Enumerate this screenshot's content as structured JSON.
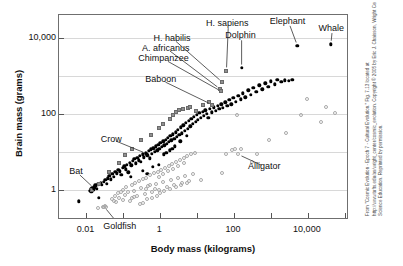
{
  "figure": {
    "credit": "From \"Cosmic Evolution - Epoch 7 - Cultural Evolution.\" Fig. 7.13 located at http://www.tufts.edu/as/wright_center/cosmic_evolution. Copyright © 2005 by Eric J. Chaisson, Wright Center for Science Education. Reprinted by permission."
  },
  "chart_data": {
    "type": "scatter",
    "title": "",
    "xlabel": "Body mass (kilograms)",
    "ylabel": "Brain mass (grams)",
    "xscale": "log",
    "yscale": "log",
    "xlim": [
      0.0018,
      130000
    ],
    "ylim": [
      0.16,
      40000
    ],
    "grid": true,
    "legend_position": "none",
    "xticks": [
      {
        "value": 0.01,
        "label": "0.01"
      },
      {
        "value": 1,
        "label": "1"
      },
      {
        "value": 100,
        "label": "100"
      },
      {
        "value": 10000,
        "label": "10,000"
      }
    ],
    "xminorticks": [
      0.1,
      10,
      1000,
      100000
    ],
    "yticks": [
      {
        "value": 10000,
        "label": "10,000"
      },
      {
        "value": 100,
        "label": "100"
      },
      {
        "value": 1,
        "label": "1"
      }
    ],
    "gridlines_y": [
      10000,
      1000,
      100,
      10,
      1,
      0.1
    ],
    "series": [
      {
        "name": "mammals-and-birds",
        "marker": "filled-circle",
        "color": "#000000",
        "points": [
          [
            0.0062,
            0.5
          ],
          [
            0.0125,
            0.95
          ],
          [
            0.013,
            1.05
          ],
          [
            0.0135,
            0.88
          ],
          [
            0.0142,
            1.1
          ],
          [
            0.0148,
            0.98
          ],
          [
            0.0155,
            1.2
          ],
          [
            0.016,
            1.0
          ],
          [
            0.0165,
            1.15
          ],
          [
            0.0172,
            1.3
          ],
          [
            0.018,
            1.25
          ],
          [
            0.019,
            1.05
          ],
          [
            0.0205,
            1.4
          ],
          [
            0.0215,
            0.62
          ],
          [
            0.024,
            1.5
          ],
          [
            0.026,
            1.35
          ],
          [
            0.029,
            1.6
          ],
          [
            0.032,
            1.8
          ],
          [
            0.035,
            1.45
          ],
          [
            0.038,
            2.0
          ],
          [
            0.042,
            2.3
          ],
          [
            0.045,
            1.9
          ],
          [
            0.05,
            2.6
          ],
          [
            0.055,
            2.2
          ],
          [
            0.06,
            3.0
          ],
          [
            0.066,
            2.7
          ],
          [
            0.072,
            3.4
          ],
          [
            0.08,
            3.1
          ],
          [
            0.088,
            2.5
          ],
          [
            0.095,
            3.8
          ],
          [
            0.105,
            4.2
          ],
          [
            0.115,
            3.5
          ],
          [
            0.125,
            4.6
          ],
          [
            0.135,
            2.9
          ],
          [
            0.15,
            5.2
          ],
          [
            0.165,
            4.4
          ],
          [
            0.18,
            5.8
          ],
          [
            0.2,
            6.5
          ],
          [
            0.22,
            5.0
          ],
          [
            0.24,
            7.0
          ],
          [
            0.26,
            6.0
          ],
          [
            0.28,
            7.8
          ],
          [
            0.3,
            5.5
          ],
          [
            0.33,
            8.5
          ],
          [
            0.36,
            7.2
          ],
          [
            0.4,
            9.5
          ],
          [
            0.44,
            8.0
          ],
          [
            0.48,
            10.5
          ],
          [
            0.52,
            6.8
          ],
          [
            0.56,
            11.5
          ],
          [
            0.6,
            9.0
          ],
          [
            0.65,
            12.5
          ],
          [
            0.7,
            10.0
          ],
          [
            0.76,
            14.0
          ],
          [
            0.82,
            11.0
          ],
          [
            0.88,
            15.5
          ],
          [
            0.95,
            12.0
          ],
          [
            1.0,
            17.0
          ],
          [
            1.1,
            13.5
          ],
          [
            1.2,
            19.0
          ],
          [
            1.3,
            15.0
          ],
          [
            1.4,
            21.0
          ],
          [
            1.5,
            16.5
          ],
          [
            1.6,
            23.0
          ],
          [
            1.7,
            18.0
          ],
          [
            1.85,
            26.0
          ],
          [
            2.0,
            20.0
          ],
          [
            2.2,
            29.0
          ],
          [
            2.4,
            22.0
          ],
          [
            2.6,
            33.0
          ],
          [
            2.8,
            25.0
          ],
          [
            3.0,
            38.0
          ],
          [
            3.3,
            28.0
          ],
          [
            3.6,
            44.0
          ],
          [
            3.9,
            31.0
          ],
          [
            4.2,
            50.0
          ],
          [
            4.6,
            36.0
          ],
          [
            5.0,
            57.0
          ],
          [
            5.5,
            41.0
          ],
          [
            6.0,
            65.0
          ],
          [
            6.5,
            47.0
          ],
          [
            7.0,
            75.0
          ],
          [
            7.6,
            54.0
          ],
          [
            8.2,
            85.0
          ],
          [
            9.0,
            62.0
          ],
          [
            9.8,
            95.0
          ],
          [
            10.5,
            70.0
          ],
          [
            11.5,
            105.0
          ],
          [
            12.5,
            80.0
          ],
          [
            14.0,
            115.0
          ],
          [
            15.0,
            90.0
          ],
          [
            16.5,
            125.0
          ],
          [
            18.0,
            100.0
          ],
          [
            20.0,
            78.0
          ],
          [
            22.0,
            135.0
          ],
          [
            25.0,
            110.0
          ],
          [
            28.0,
            150.0
          ],
          [
            32.0,
            120.0
          ],
          [
            36.0,
            165.0
          ],
          [
            40.0,
            135.0
          ],
          [
            45.0,
            180.0
          ],
          [
            50.0,
            145.0
          ],
          [
            58.0,
            200.0
          ],
          [
            65.0,
            160.0
          ],
          [
            75.0,
            230.0
          ],
          [
            85.0,
            180.0
          ],
          [
            95.0,
            260.0
          ],
          [
            110.0,
            210.0
          ],
          [
            130.0,
            300.0
          ],
          [
            150.0,
            240.0
          ],
          [
            175.0,
            350.0
          ],
          [
            200.0,
            270.0
          ],
          [
            240.0,
            420.0
          ],
          [
            280.0,
            320.0
          ],
          [
            330.0,
            480.0
          ],
          [
            400.0,
            380.0
          ],
          [
            480.0,
            560.0
          ],
          [
            580.0,
            440.0
          ],
          [
            700.0,
            640.0
          ],
          [
            850.0,
            520.0
          ],
          [
            1000.0,
            720.0
          ],
          [
            1250.0,
            600.0
          ],
          [
            1500.0,
            800.0
          ],
          [
            1900.0,
            690.0
          ],
          [
            2400.0,
            760.0
          ],
          [
            3000.0,
            740.0
          ],
          [
            3800.0,
            800.0
          ],
          [
            0.45,
            2.6
          ],
          [
            0.9,
            4.5
          ],
          [
            1.25,
            8.5
          ],
          [
            1.8,
            11.0
          ],
          [
            2.5,
            14.0
          ],
          [
            3.5,
            19.0
          ],
          [
            5.2,
            26.0
          ],
          [
            0.34,
            3.2
          ],
          [
            0.62,
            4.0
          ],
          [
            1.45,
            9.5
          ],
          [
            2.1,
            12.0
          ],
          [
            0.16,
            2.2
          ]
        ]
      },
      {
        "name": "fish-reptiles-amphibians",
        "marker": "open-circle",
        "color": "#a8a8a8",
        "points": [
          [
            0.021,
            0.33
          ],
          [
            0.028,
            0.36
          ],
          [
            0.031,
            0.37
          ],
          [
            0.034,
            0.35
          ],
          [
            0.05,
            0.58
          ],
          [
            0.055,
            0.52
          ],
          [
            0.06,
            0.7
          ],
          [
            0.065,
            0.48
          ],
          [
            0.07,
            0.8
          ],
          [
            0.078,
            0.62
          ],
          [
            0.085,
            0.9
          ],
          [
            0.095,
            0.55
          ],
          [
            0.1,
            1.0
          ],
          [
            0.11,
            0.72
          ],
          [
            0.12,
            1.15
          ],
          [
            0.135,
            0.85
          ],
          [
            0.15,
            0.5
          ],
          [
            0.17,
            1.3
          ],
          [
            0.19,
            0.95
          ],
          [
            0.21,
            1.5
          ],
          [
            0.24,
            0.68
          ],
          [
            0.27,
            1.7
          ],
          [
            0.3,
            1.1
          ],
          [
            0.34,
            1.9
          ],
          [
            0.38,
            0.78
          ],
          [
            0.42,
            2.1
          ],
          [
            0.47,
            1.25
          ],
          [
            0.53,
            2.4
          ],
          [
            0.6,
            0.88
          ],
          [
            0.67,
            2.7
          ],
          [
            0.75,
            1.4
          ],
          [
            0.85,
            3.0
          ],
          [
            0.95,
            1.0
          ],
          [
            1.05,
            3.4
          ],
          [
            1.2,
            1.6
          ],
          [
            1.35,
            3.8
          ],
          [
            1.5,
            1.15
          ],
          [
            1.7,
            4.3
          ],
          [
            1.9,
            1.8
          ],
          [
            2.1,
            4.8
          ],
          [
            2.4,
            1.3
          ],
          [
            2.7,
            5.4
          ],
          [
            3.0,
            2.0
          ],
          [
            3.4,
            6.0
          ],
          [
            3.8,
            1.5
          ],
          [
            4.3,
            6.8
          ],
          [
            4.8,
            2.3
          ],
          [
            5.4,
            7.6
          ],
          [
            6.0,
            1.7
          ],
          [
            6.8,
            8.5
          ],
          [
            7.6,
            2.6
          ],
          [
            8.5,
            9.5
          ],
          [
            0.17,
            0.6
          ],
          [
            0.2,
            0.65
          ],
          [
            0.28,
            0.42
          ],
          [
            0.33,
            0.45
          ],
          [
            0.4,
            1.05
          ],
          [
            0.45,
            0.58
          ],
          [
            0.52,
            1.35
          ],
          [
            0.58,
            0.62
          ],
          [
            0.7,
            1.05
          ],
          [
            0.8,
            0.7
          ],
          [
            0.9,
            2.2
          ],
          [
            1.0,
            0.8
          ],
          [
            1.15,
            2.6
          ],
          [
            1.3,
            0.92
          ],
          [
            1.6,
            3.1
          ],
          [
            1.8,
            1.05
          ],
          [
            2.2,
            3.6
          ],
          [
            2.6,
            1.2
          ],
          [
            3.1,
            4.2
          ],
          [
            3.6,
            1.35
          ],
          [
            4.4,
            5.0
          ],
          [
            5.2,
            1.55
          ],
          [
            13.0,
            1.8
          ],
          [
            48.0,
            2.8
          ],
          [
            62.0,
            9.0
          ],
          [
            90.0,
            11.0
          ],
          [
            105.0,
            12.0
          ],
          [
            120.0,
            95.0
          ],
          [
            150.0,
            11.5
          ],
          [
            300.0,
            5.5
          ],
          [
            420.0,
            8.5
          ],
          [
            900.0,
            20.0
          ],
          [
            2600.0,
            32.0
          ],
          [
            6500.0,
            95.0
          ],
          [
            9500.0,
            240.0
          ],
          [
            22000.0,
            60.0
          ],
          [
            30000.0,
            155.0
          ],
          [
            55000.0,
            105.0
          ]
        ]
      },
      {
        "name": "hominids",
        "marker": "gray-square",
        "color": "#909090",
        "points": [
          [
            2.2,
            95.0
          ],
          [
            2.6,
            110.0
          ],
          [
            3.2,
            125.0
          ],
          [
            4.2,
            130.0
          ],
          [
            1.2,
            55.0
          ],
          [
            0.55,
            28.0
          ],
          [
            0.3,
            20.0
          ],
          [
            0.11,
            8.0
          ],
          [
            0.075,
            5.0
          ],
          [
            0.17,
            12.0
          ],
          [
            1.8,
            75.0
          ],
          [
            5.5,
            140.0
          ],
          [
            9.0,
            120.0
          ],
          [
            14.0,
            170.0
          ],
          [
            0.042,
            3.0
          ],
          [
            0.022,
            1.4
          ],
          [
            0.014,
            1.0
          ],
          [
            6.5,
            150.0
          ],
          [
            21.0,
            200.0
          ],
          [
            0.9,
            42.0
          ]
        ]
      }
    ],
    "labeled_points": [
      {
        "label": "H. sapiens",
        "x": 62,
        "y": 1350,
        "marker": "gray-square",
        "label_x": 70,
        "label_y": 23000,
        "anchor_dx": 0,
        "anchor_dy": 0
      },
      {
        "label": "H. habilis",
        "x": 48,
        "y": 680,
        "marker": "gray-square",
        "label_x": 2.2,
        "label_y": 9500,
        "anchor_dx": 0,
        "anchor_dy": 0
      },
      {
        "label": "A. africanus",
        "x": 42,
        "y": 450,
        "marker": "gray-square",
        "label_x": 1.5,
        "label_y": 5200,
        "anchor_dx": 0,
        "anchor_dy": 0
      },
      {
        "label": "Chimpanzee",
        "x": 45,
        "y": 390,
        "marker": "gray-square",
        "label_x": 1.3,
        "label_y": 2700,
        "anchor_dx": 0,
        "anchor_dy": 0
      },
      {
        "label": "Baboon",
        "x": 25,
        "y": 175,
        "marker": "gray-square",
        "label_x": 1.1,
        "label_y": 760,
        "anchor_dx": 0,
        "anchor_dy": 0
      },
      {
        "label": "Dolphin",
        "x": 160,
        "y": 1600,
        "marker": "filled-circle",
        "label_x": 160,
        "label_y": 11000,
        "anchor_dx": 0,
        "anchor_dy": 0
      },
      {
        "label": "Elephant",
        "x": 5200,
        "y": 6200,
        "marker": "filled-circle",
        "label_x": 3000,
        "label_y": 26000,
        "anchor_dx": 0,
        "anchor_dy": 0
      },
      {
        "label": "Whale",
        "x": 42000,
        "y": 6800,
        "marker": "filled-circle",
        "label_x": 46000,
        "label_y": 17000,
        "anchor_dx": 0,
        "anchor_dy": 0
      },
      {
        "label": "Crow",
        "x": 0.42,
        "y": 9.0,
        "marker": "filled-circle",
        "label_x": 0.05,
        "label_y": 21.0,
        "anchor_dx": 0,
        "anchor_dy": 0
      },
      {
        "label": "Bat",
        "x": 0.016,
        "y": 1.1,
        "marker": "filled-circle",
        "label_x": 0.0055,
        "label_y": 2.9,
        "anchor_dx": 0,
        "anchor_dy": 0
      },
      {
        "label": "Alligator",
        "x": 130,
        "y": 8.5,
        "marker": "open-circle",
        "label_x": 700,
        "label_y": 4.0,
        "anchor_dx": 0,
        "anchor_dy": 0
      },
      {
        "label": "Goldfish",
        "x": 0.03,
        "y": 0.36,
        "marker": "open-circle",
        "label_x": 0.085,
        "label_y": 0.105,
        "anchor_dx": 0,
        "anchor_dy": 0
      }
    ]
  }
}
